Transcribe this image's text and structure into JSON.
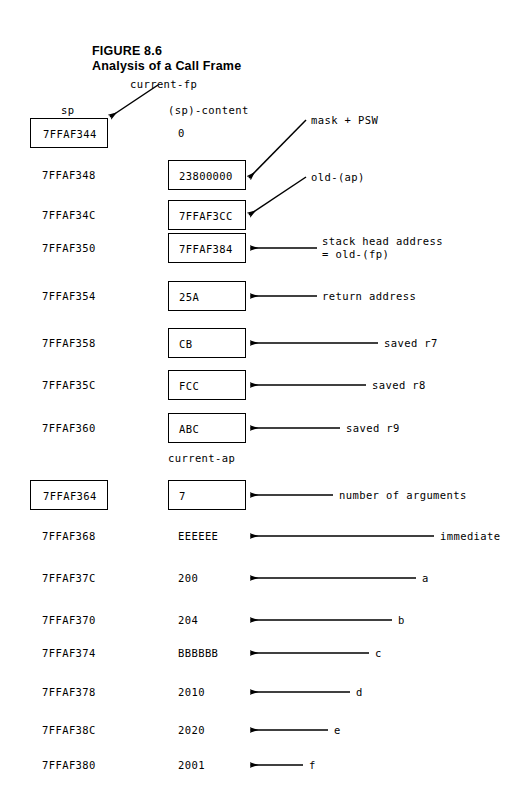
{
  "figure": {
    "label": "FIGURE 8.6",
    "subtitle": "Analysis of a Call Frame"
  },
  "pointers": {
    "current_fp": "current-fp",
    "current_ap": "current-ap"
  },
  "columns": {
    "address_header": "sp",
    "content_header": "(sp)-content"
  },
  "rows": [
    {
      "address": "7FFAF344",
      "value": "0",
      "note": "mask + PSW"
    },
    {
      "address": "7FFAF348",
      "value": "23800000",
      "note": "old-(ap)"
    },
    {
      "address": "7FFAF34C",
      "value": "7FFAF3CC",
      "note": ""
    },
    {
      "address": "7FFAF350",
      "value": "7FFAF384",
      "note": "stack head address\n= old-(fp)"
    },
    {
      "address": "7FFAF354",
      "value": "25A",
      "note": "return address"
    },
    {
      "address": "7FFAF358",
      "value": "CB",
      "note": "saved r7"
    },
    {
      "address": "7FFAF35C",
      "value": "FCC",
      "note": "saved r8"
    },
    {
      "address": "7FFAF360",
      "value": "ABC",
      "note": "saved r9"
    },
    {
      "address": "7FFAF364",
      "value": "7",
      "note": "number of arguments"
    },
    {
      "address": "7FFAF368",
      "value": "EEEEEE",
      "note": "immediate"
    },
    {
      "address": "7FFAF37C",
      "value": "200",
      "note": "a"
    },
    {
      "address": "7FFAF370",
      "value": "204",
      "note": "b"
    },
    {
      "address": "7FFAF374",
      "value": "BBBBBB",
      "note": "c"
    },
    {
      "address": "7FFAF378",
      "value": "2010",
      "note": "d"
    },
    {
      "address": "7FFAF38C",
      "value": "2020",
      "note": "e"
    },
    {
      "address": "7FFAF380",
      "value": "2001",
      "note": "f"
    }
  ],
  "colors": {
    "ink": "#000000",
    "paper": "#ffffff"
  }
}
